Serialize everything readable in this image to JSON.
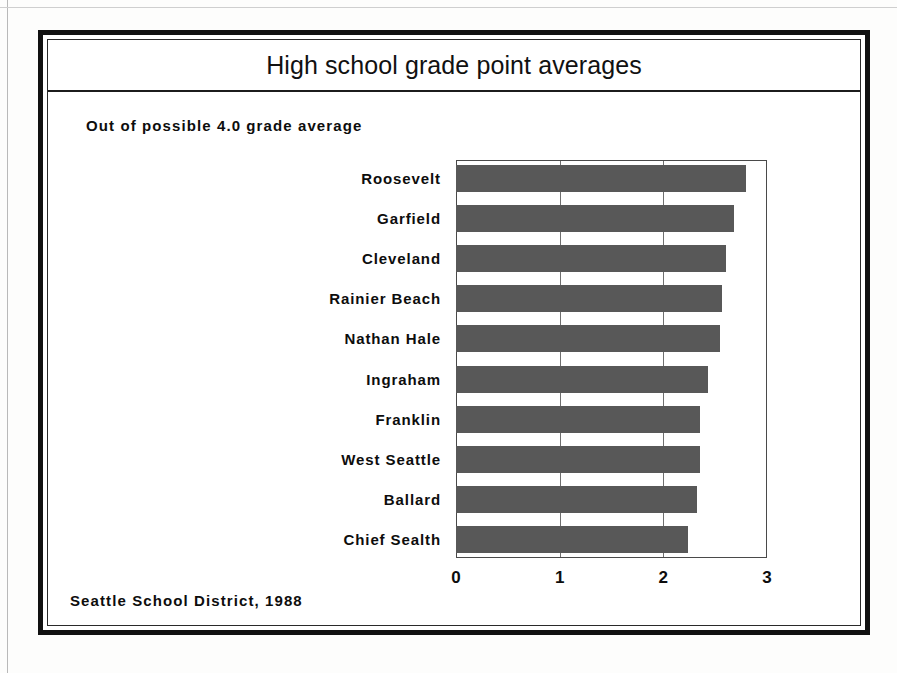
{
  "chart_data": {
    "type": "bar",
    "orientation": "horizontal",
    "title": "High school grade point averages",
    "subtitle": "Out of possible 4.0 grade average",
    "source": "Seattle School District, 1988",
    "xlabel": "",
    "ylabel": "",
    "xlim": [
      0,
      3
    ],
    "xticks": [
      "0",
      "1",
      "2",
      "3"
    ],
    "xtick_values": [
      0,
      1,
      2,
      3
    ],
    "grid": "vertical gridlines at 1 and 2",
    "legend": "none",
    "bar_color": "#585858",
    "categories": [
      "Roosevelt",
      "Garfield",
      "Cleveland",
      "Rainier Beach",
      "Nathan Hale",
      "Ingraham",
      "Franklin",
      "West Seattle",
      "Ballard",
      "Chief Sealth"
    ],
    "values": [
      2.8,
      2.68,
      2.6,
      2.57,
      2.55,
      2.43,
      2.35,
      2.35,
      2.32,
      2.24
    ]
  },
  "frame": {
    "border_color": "#111111"
  }
}
